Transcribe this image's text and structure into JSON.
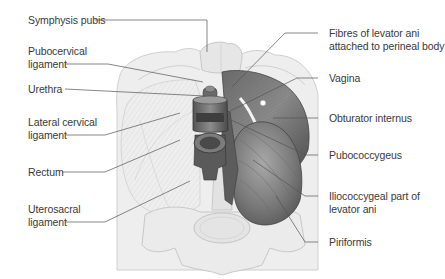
{
  "figure": {
    "labels_left": [
      {
        "id": "symphysis-pubis",
        "lines": [
          "Symphysis pubis"
        ]
      },
      {
        "id": "pubocervical-ligament",
        "lines": [
          "Pubocervical",
          "ligament"
        ]
      },
      {
        "id": "urethra",
        "lines": [
          "Urethra"
        ]
      },
      {
        "id": "lateral-cervical-ligament",
        "lines": [
          "Lateral cervical",
          "ligament"
        ]
      },
      {
        "id": "rectum",
        "lines": [
          "Rectum"
        ]
      },
      {
        "id": "uterosacral-ligament",
        "lines": [
          "Uterosacral",
          "ligament"
        ]
      }
    ],
    "labels_right": [
      {
        "id": "fibres-levator-ani",
        "lines": [
          "Fibres of levator ani",
          "attached to perineal body"
        ]
      },
      {
        "id": "vagina",
        "lines": [
          "Vagina"
        ]
      },
      {
        "id": "obturator-internus",
        "lines": [
          "Obturator internus"
        ]
      },
      {
        "id": "pubococcygeus",
        "lines": [
          "Pubococcygeus"
        ]
      },
      {
        "id": "iliococcygeal",
        "lines": [
          "Iliococcygeal part of",
          "levator ani"
        ]
      },
      {
        "id": "piriformis",
        "lines": [
          "Piriformis"
        ]
      }
    ]
  }
}
